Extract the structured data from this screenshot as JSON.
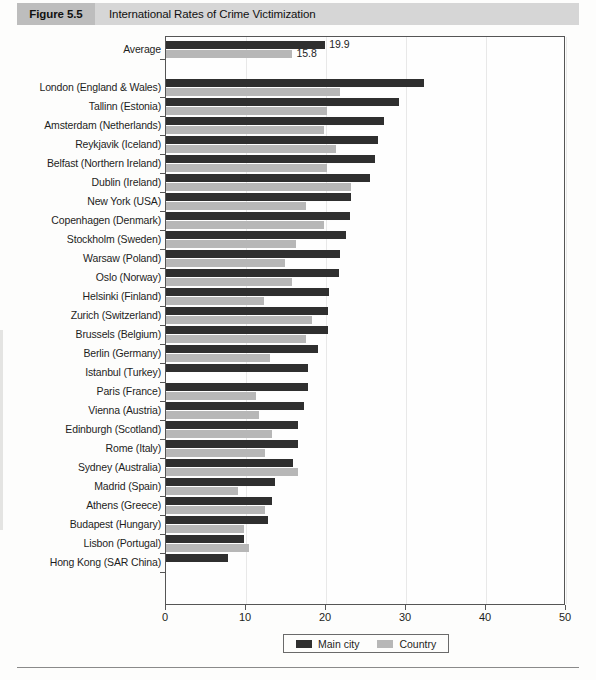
{
  "header": {
    "figure_number": "Figure 5.5",
    "title": "International Rates of Crime Victimization"
  },
  "legend": {
    "items": [
      {
        "label": "Main city",
        "color": "#2f2f2f",
        "swatch_name": "legend-swatch-main-city"
      },
      {
        "label": "Country",
        "color": "#b7b7b7",
        "swatch_name": "legend-swatch-country"
      }
    ]
  },
  "axis": {
    "ticks": [
      "0",
      "10",
      "20",
      "30",
      "40",
      "50"
    ],
    "min": 0,
    "max": 50,
    "step": 10
  },
  "chart_data": {
    "type": "bar",
    "orientation": "horizontal",
    "title": "International Rates of Crime Victimization",
    "xlabel": "",
    "ylabel": "",
    "xlim": [
      0,
      50
    ],
    "xticks": [
      0,
      10,
      20,
      30,
      40,
      50
    ],
    "grid": true,
    "legend_position": "bottom",
    "legend_entries": [
      "Main city",
      "Country"
    ],
    "value_labels_shown_for": [
      "Average"
    ],
    "series": [
      {
        "name": "Main city",
        "color": "#2f2f2f"
      },
      {
        "name": "Country",
        "color": "#b7b7b7"
      }
    ],
    "summary_row": {
      "category": "Average",
      "main_city": 19.9,
      "country": 15.8,
      "main_city_label": "19.9",
      "country_label": "15.8"
    },
    "categories": [
      "London (England & Wales)",
      "Tallinn (Estonia)",
      "Amsterdam (Netherlands)",
      "Reykjavik (Iceland)",
      "Belfast (Northern Ireland)",
      "Dublin (Ireland)",
      "New York (USA)",
      "Copenhagen (Denmark)",
      "Stockholm (Sweden)",
      "Warsaw (Poland)",
      "Oslo (Norway)",
      "Helsinki (Finland)",
      "Zurich (Switzerland)",
      "Brussels (Belgium)",
      "Berlin (Germany)",
      "Istanbul (Turkey)",
      "Paris (France)",
      "Vienna (Austria)",
      "Edinburgh (Scotland)",
      "Rome (Italy)",
      "Sydney (Australia)",
      "Madrid (Spain)",
      "Athens (Greece)",
      "Budapest (Hungary)",
      "Lisbon (Portugal)",
      "Hong Kong (SAR China)"
    ],
    "values": {
      "main_city": [
        32.2,
        29.1,
        27.3,
        26.5,
        26.1,
        25.5,
        23.1,
        23.0,
        22.5,
        21.8,
        21.6,
        20.4,
        20.3,
        20.2,
        19.0,
        17.8,
        17.7,
        17.2,
        16.5,
        16.5,
        15.9,
        13.6,
        13.3,
        12.7,
        9.7,
        7.8
      ],
      "country": [
        21.7,
        20.1,
        19.8,
        21.2,
        20.1,
        23.1,
        17.5,
        19.8,
        16.2,
        14.9,
        15.8,
        12.3,
        18.3,
        17.5,
        13.0,
        null,
        11.2,
        11.6,
        13.3,
        12.4,
        16.5,
        9.0,
        12.4,
        9.8,
        10.4,
        null
      ]
    }
  }
}
